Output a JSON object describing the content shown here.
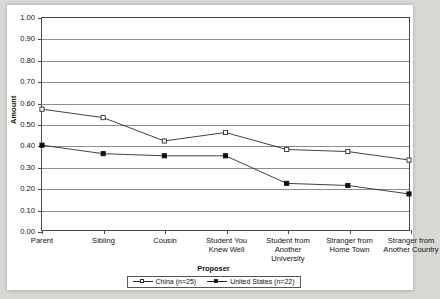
{
  "chart_data": {
    "type": "line",
    "title": "",
    "xlabel": "Proposer",
    "ylabel": "Amount",
    "ylim": [
      0.0,
      1.0
    ],
    "ytick_step": 0.1,
    "grid": true,
    "legend_position": "bottom",
    "categories": [
      "Parent",
      "Sibling",
      "Cousin",
      "Student You Knew Well",
      "Student from Another University",
      "Stranger from Home Town",
      "Stranger from Another Country"
    ],
    "ytick_labels": [
      "1.00",
      "0.90",
      "0.80",
      "0.70",
      "0.60",
      "0.50",
      "0.40",
      "0.30",
      "0.20",
      "0.10",
      "0.00"
    ],
    "series": [
      {
        "name": "China (n=25)",
        "marker": "open-square",
        "values": [
          0.57,
          0.53,
          0.42,
          0.46,
          0.38,
          0.37,
          0.33
        ]
      },
      {
        "name": "United States (n=22)",
        "marker": "filled-square",
        "values": [
          0.4,
          0.36,
          0.35,
          0.35,
          0.22,
          0.21,
          0.17
        ]
      }
    ]
  },
  "colors": {
    "line": "#2a2a2a",
    "grid": "#8d8d8d",
    "frame": "#4a4a4a",
    "plot_background": "#ffffff",
    "page_background": "#d8d8d4"
  }
}
